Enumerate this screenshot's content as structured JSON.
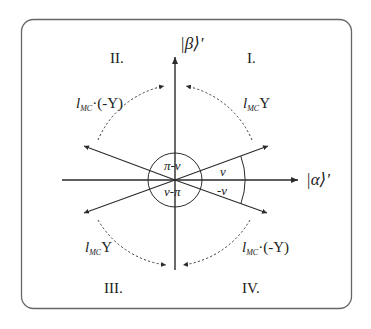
{
  "diagram": {
    "title": "",
    "axes": {
      "horizontal_label": "|α⟩′",
      "vertical_label": "|β⟩′"
    },
    "quadrants": [
      {
        "id": "I",
        "label": "I."
      },
      {
        "id": "II",
        "label": "II."
      },
      {
        "id": "III",
        "label": "III."
      },
      {
        "id": "IV",
        "label": "IV."
      }
    ],
    "angles": {
      "nu": "ν",
      "minus_nu": "-ν",
      "pi_minus_nu": "π-ν",
      "nu_minus_pi": "ν-π"
    },
    "operators": {
      "q1": {
        "l": "l",
        "sub": "MC",
        "rest": "Υ"
      },
      "q2": {
        "l": "l",
        "sub": "MC",
        "rest": "·(-Υ)"
      },
      "q3": {
        "l": "l",
        "sub": "MC",
        "rest": "Υ"
      },
      "q4": {
        "l": "l",
        "sub": "MC",
        "rest": "·(-Υ)"
      }
    },
    "colors": {
      "line": "#2a2a2a",
      "frame": "#555555",
      "background": "#ffffff"
    }
  }
}
